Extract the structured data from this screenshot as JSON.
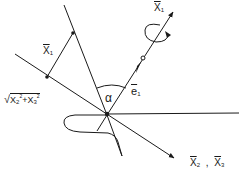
{
  "diagram": {
    "labels": {
      "x1_top": {
        "base": "X",
        "sub": "1"
      },
      "x1_segment": {
        "base": "X",
        "sub": "1"
      },
      "sqrt_expr": {
        "radical": "√",
        "term1_base": "X",
        "term1_sub": "2",
        "term1_sup": "2",
        "plus": "+",
        "term2_base": "X",
        "term2_sub": "3",
        "term2_sup": "2"
      },
      "alpha": "α",
      "e1": {
        "base": "e",
        "sub": "1"
      },
      "x2_x3": {
        "a_base": "X",
        "a_sub": "2",
        "sep": ",",
        "b_base": "X",
        "b_sub": "3"
      }
    },
    "colors": {
      "ink": "#1a1a1a",
      "background": "#ffffff"
    }
  }
}
